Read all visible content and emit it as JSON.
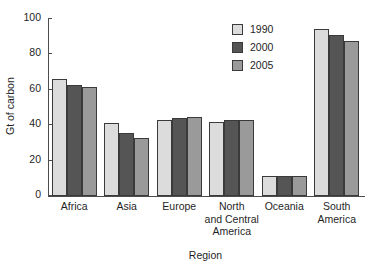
{
  "chart_data": {
    "type": "bar",
    "title": "",
    "xlabel": "Region",
    "ylabel": "Gt of carbon",
    "categories": [
      "Africa",
      "Asia",
      "Europe",
      "North and Central America",
      "Oceania",
      "South America"
    ],
    "category_labels": [
      [
        "Africa"
      ],
      [
        "Asia"
      ],
      [
        "Europe"
      ],
      [
        "North",
        "and Central",
        "America"
      ],
      [
        "Oceania"
      ],
      [
        "South",
        "America"
      ]
    ],
    "series": [
      {
        "name": "1990",
        "color": "#dcdcdc",
        "values": [
          66,
          41.5,
          43,
          42,
          11.3,
          94.5
        ]
      },
      {
        "name": "2000",
        "color": "#555555",
        "values": [
          63,
          35.5,
          44,
          42.7,
          11.5,
          91
        ]
      },
      {
        "name": "2005",
        "color": "#9a9a9a",
        "values": [
          61.5,
          33,
          44.5,
          42.8,
          11.4,
          87.5
        ]
      }
    ],
    "ylim": [
      0,
      100
    ],
    "yticks": [
      100,
      80,
      60,
      40,
      20,
      0
    ],
    "ytick_labels": [
      "100",
      "80",
      "60",
      "40",
      "20",
      "0"
    ],
    "grid": false,
    "legend_position": "top-right",
    "legend_entries": [
      "1990",
      "2000",
      "2005"
    ],
    "axis_color": "#4d4d4d",
    "bar_edge_color": "#3a3a3a"
  }
}
